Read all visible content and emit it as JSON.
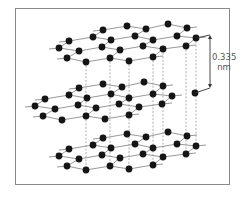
{
  "figure": {
    "spacing_label": {
      "value": "0.335",
      "unit": "nm"
    },
    "colors": {
      "atom": "#151515",
      "bond": "#8c8c8c",
      "frame": "#8a8a8a",
      "dash": "#9a9a9a",
      "label": "#555555"
    }
  },
  "lattice": {
    "atom_radius": 3.4,
    "layer_rows": [
      [
        [
          103,
          30
        ],
        [
          127,
          26
        ],
        [
          146,
          29
        ],
        [
          168,
          24
        ],
        [
          187,
          28
        ]
      ],
      [
        [
          69,
          41
        ],
        [
          93,
          37
        ],
        [
          111,
          40
        ],
        [
          135,
          36
        ],
        [
          153,
          40
        ],
        [
          177,
          36
        ],
        [
          196,
          38
        ]
      ],
      [
        [
          59,
          48
        ],
        [
          79,
          51
        ],
        [
          102,
          47
        ],
        [
          120,
          50
        ],
        [
          143,
          46
        ],
        [
          163,
          49
        ],
        [
          186,
          46
        ]
      ],
      [
        [
          67,
          58
        ],
        [
          86,
          62
        ],
        [
          110,
          58
        ],
        [
          129,
          61
        ],
        [
          153,
          57
        ]
      ]
    ],
    "row_links": [
      [
        [
          0,
          0
        ],
        [
          1,
          1
        ]
      ],
      [
        [
          0,
          2
        ],
        [
          1,
          3
        ]
      ],
      [
        [
          0,
          4
        ],
        [
          1,
          5
        ]
      ],
      [
        [
          1,
          0
        ],
        [
          2,
          0
        ]
      ],
      [
        [
          1,
          2
        ],
        [
          2,
          2
        ]
      ],
      [
        [
          1,
          4
        ],
        [
          2,
          4
        ]
      ],
      [
        [
          1,
          6
        ],
        [
          2,
          6
        ]
      ],
      [
        [
          2,
          1
        ],
        [
          3,
          0
        ]
      ],
      [
        [
          2,
          3
        ],
        [
          3,
          2
        ]
      ],
      [
        [
          2,
          5
        ],
        [
          3,
          4
        ]
      ]
    ],
    "row_line_extend": 10,
    "layers": [
      {
        "name": "top-layer",
        "dx": 0,
        "dy": 0
      },
      {
        "name": "middle-layer",
        "dx": -24,
        "dy": 58
      },
      {
        "name": "bottom-layer",
        "dx": 0,
        "dy": 108
      }
    ],
    "extra_atoms": [
      {
        "layer": "middle-layer",
        "x": 195,
        "y": 93
      }
    ],
    "dashed_verticals": [
      {
        "x": 86,
        "y1": 62,
        "y2": 170
      },
      {
        "x": 110,
        "y1": 58,
        "y2": 166
      },
      {
        "x": 129,
        "y1": 61,
        "y2": 169
      },
      {
        "x": 153,
        "y1": 57,
        "y2": 165
      },
      {
        "x": 163,
        "y1": 49,
        "y2": 157
      },
      {
        "x": 186,
        "y1": 46,
        "y2": 154
      },
      {
        "x": 196,
        "y1": 38,
        "y2": 146
      }
    ],
    "spacing_arrow": {
      "x": 210,
      "y1": 35,
      "y2": 88,
      "top_link": [
        196,
        38
      ],
      "bottom_link": [
        195,
        93
      ]
    }
  }
}
